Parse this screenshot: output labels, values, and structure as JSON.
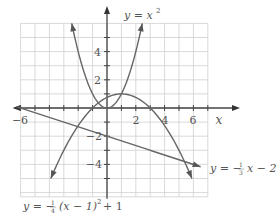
{
  "chart_data": {
    "type": "line",
    "title": "",
    "xlabel": "x",
    "ylabel": "",
    "xlim": [
      -6,
      7
    ],
    "ylim": [
      -6.3,
      6
    ],
    "grid": true,
    "x_ticks": [
      -6,
      -4,
      -2,
      0,
      2,
      4,
      6
    ],
    "x_tick_labels": [
      "-6",
      "2",
      "4",
      "6"
    ],
    "y_tick_labels": [
      "4",
      "2",
      "-2",
      "-4"
    ],
    "series": [
      {
        "name": "y = x^2",
        "label": "y = x",
        "label_sup": "2",
        "function": "x^2",
        "x": [
          -2.5,
          -2,
          -1,
          0,
          1,
          2,
          2.5
        ],
        "y": [
          6.25,
          4,
          1,
          0,
          1,
          4,
          6.25
        ]
      },
      {
        "name": "y = -1/3 x - 2",
        "label": "y = −",
        "label_frac": "1/3",
        "label_tail": "x − 2",
        "function": "-x/3-2",
        "x": [
          -6,
          0,
          6.5
        ],
        "y": [
          0,
          -2,
          -4.17
        ]
      },
      {
        "name": "y = -1/4 (x-1)^2 + 1",
        "label": "y = −",
        "label_frac": "1/4",
        "label_tail": "(x − 1)",
        "label_sup": "2",
        "label_end": " + 1",
        "function": "-(x-1)^2/4+1",
        "x": [
          -3.9,
          -3,
          -1,
          1,
          3,
          5,
          5.9
        ],
        "y": [
          -5,
          -3,
          0,
          1,
          0,
          -3,
          -5
        ]
      }
    ]
  },
  "labels": {
    "x_axis": "x",
    "tick_neg6": "−6",
    "tick_2": "2",
    "tick_4": "4",
    "tick_6": "6",
    "ytick_4": "4",
    "ytick_2": "2",
    "ytick_neg2": "−2",
    "ytick_neg4": "−4",
    "eq1_main": "y = x",
    "eq1_sup": "2",
    "eq2_pre": "y = −",
    "eq2_num": "1",
    "eq2_den": "3",
    "eq2_post": "x − 2",
    "eq3_pre": "y = −",
    "eq3_num": "1",
    "eq3_den": "4",
    "eq3_mid": "(x − 1)",
    "eq3_sup": "2",
    "eq3_post": "+ 1"
  }
}
